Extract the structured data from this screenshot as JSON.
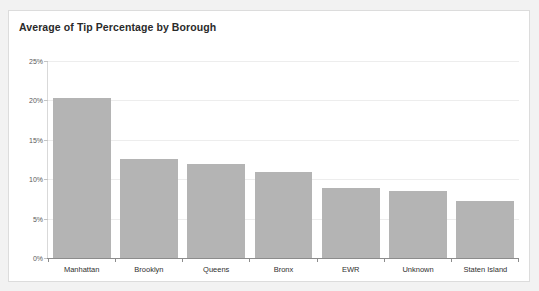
{
  "card": {
    "background": "#ffffff",
    "border_color": "#dcdcdc"
  },
  "chart_data": {
    "type": "bar",
    "title": "Average of Tip Percentage by Borough",
    "xlabel": "",
    "ylabel": "",
    "categories": [
      "Manhattan",
      "Brooklyn",
      "Queens",
      "Bronx",
      "EWR",
      "Unknown",
      "Staten Island"
    ],
    "values": [
      20.3,
      12.6,
      11.9,
      10.9,
      8.9,
      8.5,
      7.2
    ],
    "ylim": [
      0,
      25
    ],
    "ytick_values": [
      0,
      5,
      10,
      15,
      20,
      25
    ],
    "ytick_labels": [
      "0%",
      "5%",
      "10%",
      "15%",
      "20%",
      "25%"
    ],
    "grid": true,
    "legend": "none",
    "bar_color": "#b4b4b4",
    "gridline_color": "#ededed",
    "axis_color": "#8c8c8c"
  }
}
